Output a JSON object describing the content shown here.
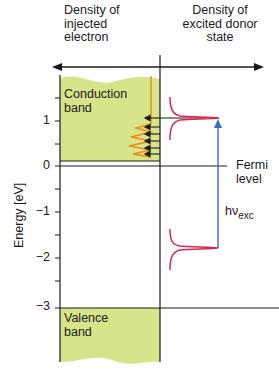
{
  "headers": {
    "left": [
      "Density of",
      "injected",
      "electron"
    ],
    "right": [
      "Density of",
      "excited donor",
      "state"
    ]
  },
  "y_axis": {
    "label": "Energy [eV]",
    "ticks": [
      "1",
      "0",
      "−1",
      "−2",
      "−3"
    ]
  },
  "bands": {
    "conduction": [
      "Conduction",
      "band"
    ],
    "valence": [
      "Valence",
      "band"
    ]
  },
  "fermi": [
    "Fermi",
    "level"
  ],
  "excitation": {
    "h": "hν",
    "sub": "exc"
  },
  "colors": {
    "band_fill": "#d6e48a",
    "orange": "#f08a1e",
    "red": "#d9284a",
    "blue": "#3a6fbf",
    "black": "#1a1a1a"
  }
}
